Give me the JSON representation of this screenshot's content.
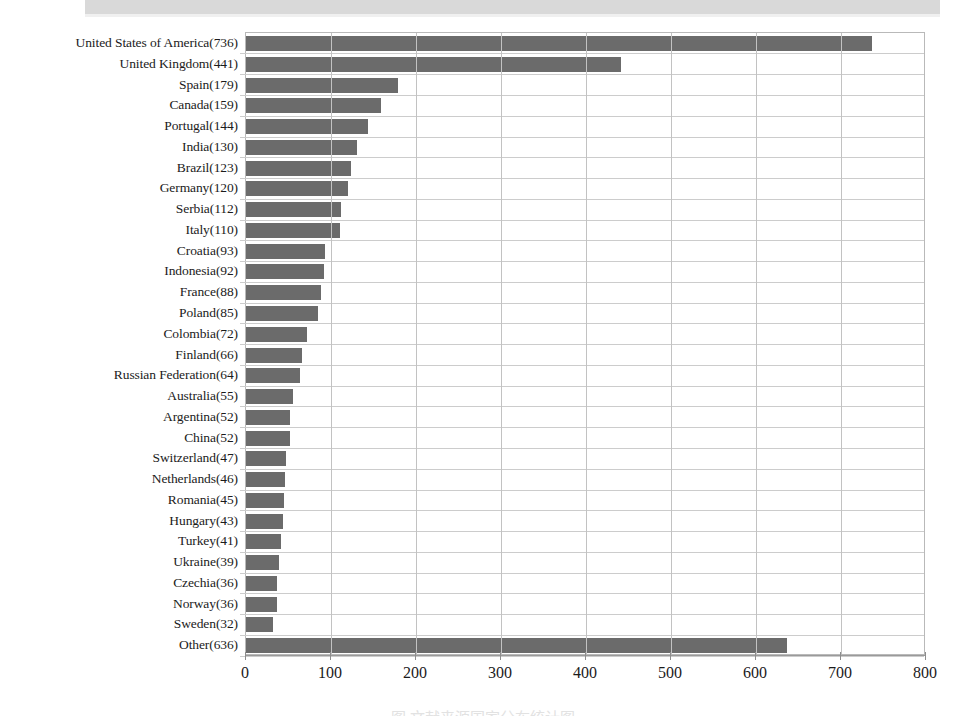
{
  "page": {
    "background_color": "#ffffff",
    "scan_band_color": "#d9d9d9",
    "caption_partial": "图  文献来源国家分布统计图"
  },
  "chart_data": {
    "type": "bar",
    "orientation": "horizontal",
    "title": "",
    "subtitle": "",
    "xlabel": "",
    "ylabel": "",
    "xlim": [
      0,
      800
    ],
    "ylim": null,
    "grid": true,
    "legend": null,
    "bar_color": "#6b6b6b",
    "xticks": [
      0,
      100,
      200,
      300,
      400,
      500,
      600,
      700,
      800
    ],
    "xtick_labels": [
      "0",
      "100",
      "200",
      "300",
      "400",
      "500",
      "600",
      "700",
      "800"
    ],
    "categories": [
      "United States of America(736)",
      "United Kingdom(441)",
      "Spain(179)",
      "Canada(159)",
      "Portugal(144)",
      "India(130)",
      "Brazil(123)",
      "Germany(120)",
      "Serbia(112)",
      "Italy(110)",
      "Croatia(93)",
      "Indonesia(92)",
      "France(88)",
      "Poland(85)",
      "Colombia(72)",
      "Finland(66)",
      "Russian Federation(64)",
      "Australia(55)",
      "Argentina(52)",
      "China(52)",
      "Switzerland(47)",
      "Netherlands(46)",
      "Romania(45)",
      "Hungary(43)",
      "Turkey(41)",
      "Ukraine(39)",
      "Czechia(36)",
      "Norway(36)",
      "Sweden(32)",
      "Other(636)"
    ],
    "country_names": [
      "United States of America",
      "United Kingdom",
      "Spain",
      "Canada",
      "Portugal",
      "India",
      "Brazil",
      "Germany",
      "Serbia",
      "Italy",
      "Croatia",
      "Indonesia",
      "France",
      "Poland",
      "Colombia",
      "Finland",
      "Russian Federation",
      "Australia",
      "Argentina",
      "China",
      "Switzerland",
      "Netherlands",
      "Romania",
      "Hungary",
      "Turkey",
      "Ukraine",
      "Czechia",
      "Norway",
      "Sweden",
      "Other"
    ],
    "values": [
      736,
      441,
      179,
      159,
      144,
      130,
      123,
      120,
      112,
      110,
      93,
      92,
      88,
      85,
      72,
      66,
      64,
      55,
      52,
      52,
      47,
      46,
      45,
      43,
      41,
      39,
      36,
      36,
      32,
      636
    ]
  }
}
